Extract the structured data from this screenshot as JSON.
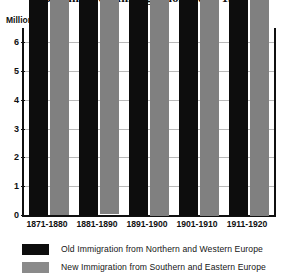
{
  "chart_data": {
    "type": "bar",
    "title": "Old and New Immigration, 1871-1920",
    "unit_caption": "Million",
    "xlabel": "",
    "ylabel": "Million",
    "ylim": [
      0,
      6.5
    ],
    "yticks": [
      0,
      1,
      2,
      3,
      4,
      5,
      6
    ],
    "ytick_labels": [
      "0",
      "1",
      "2",
      "3",
      "4",
      "5",
      "6"
    ],
    "grid": true,
    "legend_position": "bottom",
    "categories": [
      "1871-1880",
      "1881-1890",
      "1891-1900",
      "1901-1910",
      "1911-1920"
    ],
    "series": [
      {
        "name": "Old Immigration from Northern and Western Europe",
        "color": "#0d0d0d",
        "values": [
          2127000,
          3783000,
          1644000,
          1912000,
          2001000
        ],
        "value_labels": [
          "2,127,000",
          "3,783,000",
          "1,644,000",
          "1,912,000",
          "2,001,000"
        ]
      },
      {
        "name": "New Immigration from Southern and  Eastern Europe",
        "color": "#808080",
        "values": [
          145000,
          954000,
          1914000,
          6244000,
          2370000
        ],
        "value_labels": [
          "145,000",
          "954,000",
          "1,914,000",
          "6,244,000",
          "2,370,000"
        ]
      }
    ]
  },
  "legend": {
    "items": [
      {
        "label": "Old Immigration from Northern  and Western Europe",
        "swatch": "old"
      },
      {
        "label": "New Immigration from Southern and  Eastern Europe",
        "swatch": "new"
      }
    ]
  }
}
